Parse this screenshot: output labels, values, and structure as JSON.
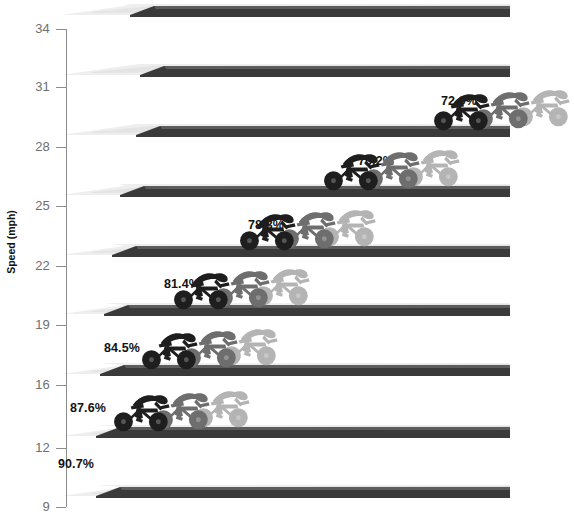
{
  "chart_data": {
    "type": "bar",
    "title": "",
    "subtitle": "",
    "xlabel": "",
    "ylabel": "Speed (mph)",
    "ylim": [
      9,
      34
    ],
    "grid": false,
    "legend": "none",
    "y_ticks": [
      34,
      31,
      28,
      25,
      22,
      19,
      16,
      12,
      9
    ],
    "y_tick_labels": [
      "34",
      "31",
      "28",
      "25",
      "22",
      "19",
      "16",
      "12",
      "9"
    ],
    "categories": [
      "34",
      "31",
      "28",
      "25",
      "22",
      "19",
      "16",
      "12",
      "9"
    ],
    "series": [
      {
        "name": "Drafting power saving",
        "values": [
          null,
          null,
          72.0,
          75.2,
          78.3,
          81.4,
          84.5,
          87.6,
          90.7
        ]
      }
    ],
    "annotations": [
      {
        "text": "72.0%",
        "speed": 30.0
      },
      {
        "text": "75.2%",
        "speed": 27.0
      },
      {
        "text": "78.3%",
        "speed": 24.0
      },
      {
        "text": "81.4%",
        "speed": 21.0
      },
      {
        "text": "84.5%",
        "speed": 18.0
      },
      {
        "text": "87.6%",
        "speed": 15.0
      },
      {
        "text": "90.7%",
        "speed": 11.0
      }
    ]
  },
  "axis": {
    "y_title": "Speed (mph)",
    "ticks": [
      {
        "label": "34",
        "y": 29
      },
      {
        "label": "31",
        "y": 87
      },
      {
        "label": "28",
        "y": 147
      },
      {
        "label": "25",
        "y": 206
      },
      {
        "label": "22",
        "y": 266
      },
      {
        "label": "19",
        "y": 325
      },
      {
        "label": "16",
        "y": 385
      },
      {
        "label": "12",
        "y": 448
      },
      {
        "label": "9",
        "y": 507
      }
    ]
  },
  "bands": [
    {
      "speed_label": "34",
      "pct": "",
      "ramp_top_y": 2,
      "ramp_start_x": 62,
      "ramp_end_x": 510,
      "step_x": 130,
      "pct_x": 0,
      "pct_y": 0,
      "riders_x": 520,
      "has_riders": false,
      "has_pct": false
    },
    {
      "speed_label": "31",
      "pct": "72.0%",
      "ramp_top_y": 62,
      "ramp_start_x": 62,
      "ramp_end_x": 510,
      "step_x": 140,
      "pct_x": 441,
      "pct_y": 94,
      "riders_x": 520,
      "has_riders": false,
      "has_pct": true
    },
    {
      "speed_label": "28",
      "pct": "75.2%",
      "ramp_top_y": 122,
      "ramp_start_x": 62,
      "ramp_end_x": 510,
      "step_x": 136,
      "pct_x": 358,
      "pct_y": 154,
      "riders_x": 432,
      "has_riders": true,
      "has_pct": true
    },
    {
      "speed_label": "25",
      "pct": "78.3%",
      "ramp_top_y": 182,
      "ramp_start_x": 62,
      "ramp_end_x": 510,
      "step_x": 120,
      "pct_x": 248,
      "pct_y": 218,
      "riders_x": 322,
      "has_riders": true,
      "has_pct": true
    },
    {
      "speed_label": "22",
      "pct": "81.4%",
      "ramp_top_y": 242,
      "ramp_start_x": 62,
      "ramp_end_x": 510,
      "step_x": 112,
      "pct_x": 164,
      "pct_y": 277,
      "riders_x": 238,
      "has_riders": true,
      "has_pct": true
    },
    {
      "speed_label": "19",
      "pct": "84.5%",
      "ramp_top_y": 301,
      "ramp_start_x": 62,
      "ramp_end_x": 510,
      "step_x": 104,
      "pct_x": 104,
      "pct_y": 341,
      "riders_x": 172,
      "has_riders": true,
      "has_pct": true
    },
    {
      "speed_label": "16",
      "pct": "87.6%",
      "ramp_top_y": 361,
      "ramp_start_x": 62,
      "ramp_end_x": 510,
      "step_x": 100,
      "pct_x": 70,
      "pct_y": 401,
      "riders_x": 140,
      "has_riders": true,
      "has_pct": true
    },
    {
      "speed_label": "12",
      "pct": "90.7%",
      "ramp_top_y": 423,
      "ramp_start_x": 62,
      "ramp_end_x": 510,
      "step_x": 96,
      "pct_x": 58,
      "pct_y": 457,
      "riders_x": 112,
      "has_riders": true,
      "has_pct": true
    },
    {
      "speed_label": "9",
      "pct": "",
      "ramp_top_y": 483,
      "ramp_start_x": 62,
      "ramp_end_x": 510,
      "step_x": 96,
      "pct_x": 0,
      "pct_y": 0,
      "riders_x": 520,
      "has_riders": false,
      "has_pct": false
    }
  ],
  "colors": {
    "ramp_light": "#eeeeee",
    "ramp_light_2": "#e4e4e4",
    "ramp_dark": "#3a3a3a",
    "ramp_dark_2": "#5d5d5d",
    "rider_dark": "#1e1e1e",
    "rider_mid": "#6e6e6e",
    "rider_light": "#b4b4b4",
    "axis": "#8c8c8c",
    "tick_text": "#6f6f6f",
    "label_text": "#121212",
    "background": "#ffffff"
  },
  "riders": {
    "count_per_group": 3,
    "shades": [
      "rider_dark",
      "rider_mid",
      "rider_light"
    ],
    "semantic": "cyclist-silhouette"
  }
}
